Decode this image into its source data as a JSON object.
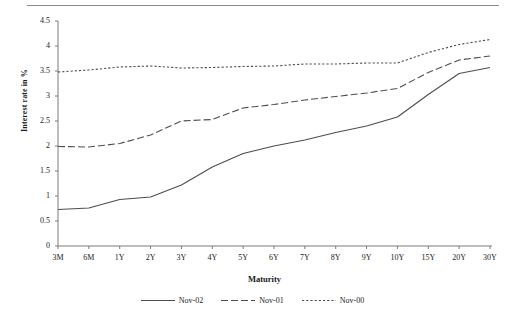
{
  "chart_data": {
    "type": "line",
    "title": "",
    "xlabel": "Maturity",
    "ylabel": "Interest rate in %",
    "categories": [
      "3M",
      "6M",
      "1Y",
      "2Y",
      "3Y",
      "4Y",
      "5Y",
      "6Y",
      "7Y",
      "8Y",
      "9Y",
      "10Y",
      "15Y",
      "20Y",
      "30Y"
    ],
    "ylim": [
      0,
      4.5
    ],
    "yticks": [
      "0",
      "0.5",
      "1",
      "1.5",
      "2",
      "2.5",
      "3",
      "3.5",
      "4",
      "4.5"
    ],
    "ytick_values": [
      0,
      0.5,
      1,
      1.5,
      2,
      2.5,
      3,
      3.5,
      4,
      4.5
    ],
    "grid": false,
    "legend_position": "bottom",
    "series": [
      {
        "name": "Nov-02",
        "style": "solid",
        "color": "#4d4d4d",
        "values": [
          0.73,
          0.76,
          0.93,
          0.98,
          1.22,
          1.58,
          1.85,
          2.0,
          2.12,
          2.27,
          2.4,
          2.58,
          3.03,
          3.45,
          3.57
        ]
      },
      {
        "name": "Nov-01",
        "style": "dashed",
        "color": "#4d4d4d",
        "values": [
          1.99,
          1.98,
          2.05,
          2.22,
          2.5,
          2.53,
          2.76,
          2.83,
          2.92,
          2.99,
          3.06,
          3.15,
          3.47,
          3.72,
          3.8
        ]
      },
      {
        "name": "Nov-00",
        "style": "dotted",
        "color": "#4d4d4d",
        "values": [
          3.48,
          3.52,
          3.58,
          3.6,
          3.56,
          3.57,
          3.59,
          3.6,
          3.64,
          3.64,
          3.66,
          3.66,
          3.87,
          4.03,
          4.13
        ]
      }
    ]
  },
  "axes": {
    "y_label_text": "Interest rate in %",
    "x_label_text": "Maturity"
  },
  "legend": {
    "entries": [
      {
        "label": "Nov-02"
      },
      {
        "label": "Nov-01"
      },
      {
        "label": "Nov-00"
      }
    ]
  }
}
